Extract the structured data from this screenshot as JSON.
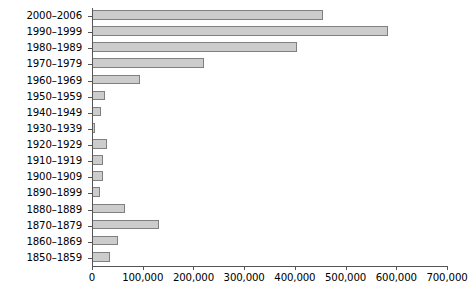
{
  "chart_data": {
    "type": "bar",
    "orientation": "horizontal",
    "title": "",
    "subtitle": "",
    "xlabel": "",
    "ylabel": "",
    "xlim": [
      0,
      700000
    ],
    "ylim": null,
    "grid": false,
    "legend": null,
    "legend_position": "none",
    "bar_color": "#cccccc",
    "bar_edge_color": "#808080",
    "axis_color": "#555555",
    "x_ticks": [
      0,
      100000,
      200000,
      300000,
      400000,
      500000,
      600000,
      700000
    ],
    "x_tick_labels": [
      "0",
      "100,000",
      "200,000",
      "300,000",
      "400,000",
      "500,000",
      "600,000",
      "700,000"
    ],
    "categories": [
      "2000–2006",
      "1990–1999",
      "1980–1989",
      "1970–1979",
      "1960–1969",
      "1950–1959",
      "1940–1949",
      "1930–1939",
      "1920–1929",
      "1910–1919",
      "1900–1909",
      "1890–1899",
      "1880–1889",
      "1870–1879",
      "1860–1869",
      "1850–1859"
    ],
    "values": [
      455000,
      583000,
      405000,
      220000,
      95000,
      25000,
      18000,
      6000,
      30000,
      22000,
      22000,
      15000,
      65000,
      133000,
      52000,
      35000
    ]
  }
}
